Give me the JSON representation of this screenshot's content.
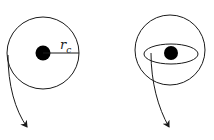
{
  "diagram": {
    "left": {
      "label_main": "r",
      "label_sub": "c",
      "description": "circle with central dot and radius line"
    },
    "right": {
      "description": "circle with ellipse (cross-section) and central dot"
    },
    "colors": {
      "stroke": "#1a1a1a",
      "fill": "#000000",
      "background": "#ffffff"
    }
  }
}
